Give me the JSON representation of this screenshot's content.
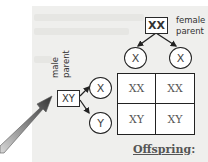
{
  "diagram": {
    "female_parent": {
      "genotype": "XX",
      "label_line1": "female",
      "label_line2": "parent",
      "gametes": [
        "X",
        "X"
      ]
    },
    "male_parent": {
      "genotype": "XY",
      "label_line1": "male",
      "label_line2": "parent",
      "gametes": [
        "X",
        "Y"
      ]
    },
    "grid": {
      "rows": [
        [
          "XX",
          "XX"
        ],
        [
          "XY",
          "XY"
        ]
      ]
    },
    "offspring_label": "Offspring",
    "offspring_colon": ":",
    "pointer": "arrow-pointing-to-male-parent"
  },
  "colors": {
    "panel_bg": "#efefed",
    "line": "#222222",
    "arrow_dark": "#333333",
    "arrow_light": "#bbbbbb"
  }
}
